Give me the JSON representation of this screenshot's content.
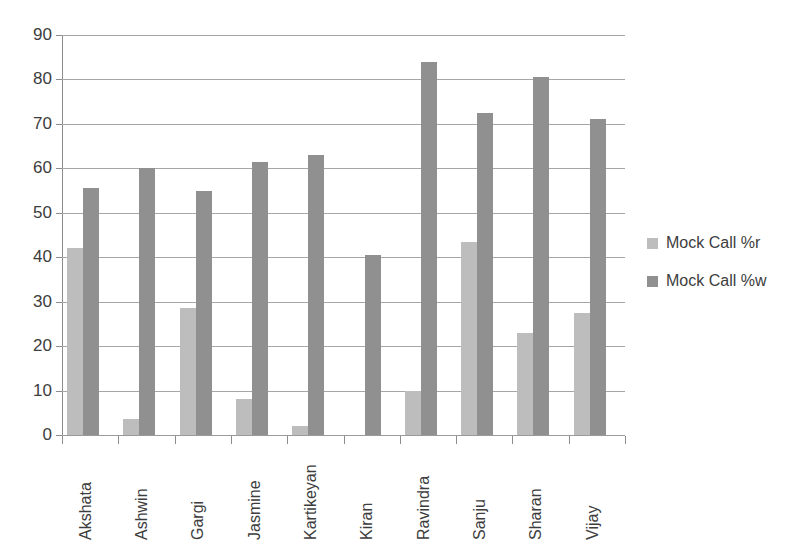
{
  "chart_data": {
    "type": "bar",
    "title": "",
    "subtitle": "",
    "xlabel": "",
    "ylabel": "",
    "ylim": [
      0,
      90
    ],
    "y_ticks": [
      0,
      10,
      20,
      30,
      40,
      50,
      60,
      70,
      80,
      90
    ],
    "grid": true,
    "legend_position": "right",
    "categories": [
      "Akshata",
      "Ashwin",
      "Gargi",
      "Jasmine",
      "Kartikeyan",
      "Kiran",
      "Ravindra",
      "Sanju",
      "Sharan",
      "Vijay"
    ],
    "series": [
      {
        "name": "Mock Call %r",
        "color": "#bdbdbd",
        "values": [
          42,
          3.5,
          28.5,
          8,
          2,
          0,
          10,
          43.5,
          23,
          27.5
        ]
      },
      {
        "name": "Mock Call %w",
        "color": "#909090",
        "values": [
          55.5,
          60,
          55,
          61.5,
          63,
          40.5,
          84,
          72.5,
          80.5,
          71
        ]
      }
    ]
  },
  "legend": {
    "items": [
      {
        "label": "Mock Call %r",
        "color": "#bdbdbd"
      },
      {
        "label": "Mock Call %w",
        "color": "#909090"
      }
    ]
  },
  "axis": {
    "y_tick_labels": [
      "90",
      "80",
      "70",
      "60",
      "50",
      "40",
      "30",
      "20",
      "10",
      "0"
    ]
  }
}
